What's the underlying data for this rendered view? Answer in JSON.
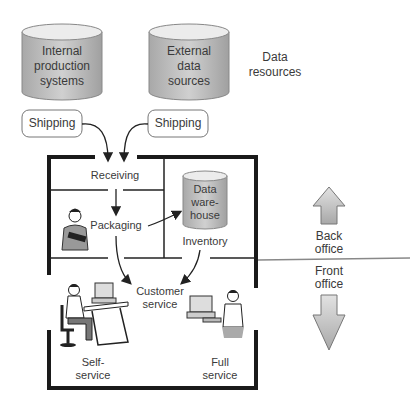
{
  "diagram": {
    "data_resources": {
      "label": "Data resources",
      "label_line1": "Data",
      "label_line2": "resources",
      "sources": [
        {
          "line1": "Internal",
          "line2": "production",
          "line3": "systems",
          "shipping": "Shipping"
        },
        {
          "line1": "External",
          "line2": "data",
          "line3": "sources",
          "shipping": "Shipping"
        }
      ]
    },
    "rooms": {
      "receiving": "Receiving",
      "packaging": "Packaging",
      "warehouse_line1": "Data",
      "warehouse_line2": "ware-",
      "warehouse_line3": "house",
      "inventory": "Inventory",
      "customer_line1": "Customer",
      "customer_line2": "service",
      "self_line1": "Self-",
      "self_line2": "service",
      "full_line1": "Full",
      "full_line2": "service"
    },
    "offices": {
      "back_line1": "Back",
      "back_line2": "office",
      "front_line1": "Front",
      "front_line2": "office"
    },
    "colors": {
      "cylinder_fill": "#b8b8b8",
      "cylinder_top": "#e8e8e8",
      "wall": "#1a1a1a",
      "arrow_fill": "#c4c4c4"
    }
  }
}
